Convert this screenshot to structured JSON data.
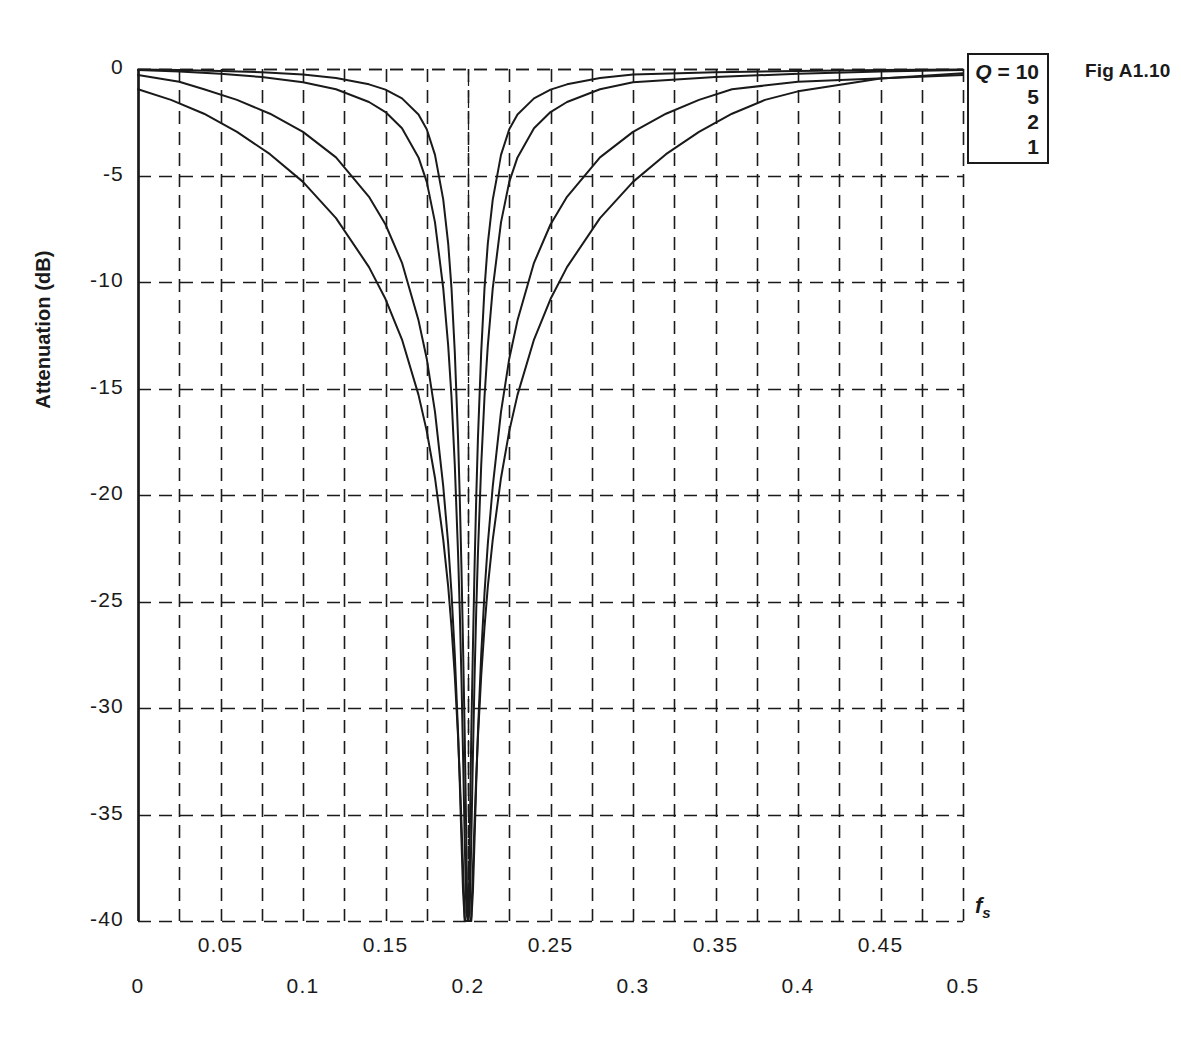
{
  "figure": {
    "fig_label": "Fig A1.10",
    "legend": {
      "q_symbol": "Q",
      "equals": " = ",
      "rows": [
        "10",
        "5",
        "2",
        "1"
      ]
    }
  },
  "chart_data": {
    "type": "line",
    "title": "",
    "xlabel": "f",
    "xlabel_sub": "s",
    "ylabel": "Attenuation (dB)",
    "xlim": [
      0,
      0.5
    ],
    "ylim": [
      -40,
      0
    ],
    "grid": true,
    "grid_x_step": 0.025,
    "grid_y_step": 5,
    "legend_position": "top-right-outside",
    "notch_center": 0.2,
    "x_ticks_upper": [
      "0.05",
      "0.15",
      "0.25",
      "0.35",
      "0.45"
    ],
    "x_ticks_upper_values": [
      0.05,
      0.15,
      0.25,
      0.35,
      0.45
    ],
    "x_ticks_lower": [
      "0",
      "0.1",
      "0.2",
      "0.3",
      "0.4",
      "0.5"
    ],
    "x_ticks_lower_values": [
      0,
      0.1,
      0.2,
      0.3,
      0.4,
      0.5
    ],
    "y_ticks": [
      "0",
      "-5",
      "-10",
      "-15",
      "-20",
      "-25",
      "-30",
      "-35",
      "-40"
    ],
    "y_tick_values": [
      0,
      -5,
      -10,
      -15,
      -20,
      -25,
      -30,
      -35,
      -40
    ],
    "series": [
      {
        "name": "Q = 10",
        "q": 10,
        "color": "#1a1a1a",
        "points": [
          [
            0.0,
            -0.02
          ],
          [
            0.025,
            -0.05
          ],
          [
            0.05,
            -0.09
          ],
          [
            0.075,
            -0.15
          ],
          [
            0.1,
            -0.26
          ],
          [
            0.12,
            -0.42
          ],
          [
            0.14,
            -0.72
          ],
          [
            0.15,
            -0.97
          ],
          [
            0.16,
            -1.38
          ],
          [
            0.17,
            -2.14
          ],
          [
            0.175,
            -2.83
          ],
          [
            0.18,
            -4.03
          ],
          [
            0.185,
            -6.13
          ],
          [
            0.188,
            -8.2
          ],
          [
            0.19,
            -10.3
          ],
          [
            0.192,
            -13.3
          ],
          [
            0.194,
            -17.4
          ],
          [
            0.195,
            -20.1
          ],
          [
            0.196,
            -23.3
          ],
          [
            0.197,
            -27.1
          ],
          [
            0.198,
            -31.2
          ],
          [
            0.199,
            -36.3
          ],
          [
            0.1995,
            -39.2
          ],
          [
            0.2,
            -40.0
          ],
          [
            0.2005,
            -39.2
          ],
          [
            0.201,
            -36.3
          ],
          [
            0.202,
            -31.2
          ],
          [
            0.203,
            -27.1
          ],
          [
            0.204,
            -23.3
          ],
          [
            0.205,
            -20.1
          ],
          [
            0.206,
            -17.4
          ],
          [
            0.208,
            -13.3
          ],
          [
            0.21,
            -10.3
          ],
          [
            0.212,
            -8.2
          ],
          [
            0.215,
            -6.13
          ],
          [
            0.22,
            -4.03
          ],
          [
            0.225,
            -2.83
          ],
          [
            0.23,
            -2.14
          ],
          [
            0.24,
            -1.38
          ],
          [
            0.25,
            -0.97
          ],
          [
            0.26,
            -0.72
          ],
          [
            0.28,
            -0.42
          ],
          [
            0.3,
            -0.26
          ],
          [
            0.35,
            -0.15
          ],
          [
            0.4,
            -0.09
          ],
          [
            0.45,
            -0.05
          ],
          [
            0.5,
            -0.02
          ]
        ]
      },
      {
        "name": "Q = 5",
        "q": 5,
        "color": "#1a1a1a",
        "points": [
          [
            0.0,
            -0.05
          ],
          [
            0.025,
            -0.12
          ],
          [
            0.05,
            -0.22
          ],
          [
            0.075,
            -0.38
          ],
          [
            0.1,
            -0.62
          ],
          [
            0.12,
            -0.95
          ],
          [
            0.14,
            -1.55
          ],
          [
            0.15,
            -2.02
          ],
          [
            0.16,
            -2.78
          ],
          [
            0.17,
            -4.15
          ],
          [
            0.175,
            -5.3
          ],
          [
            0.18,
            -7.2
          ],
          [
            0.185,
            -10.3
          ],
          [
            0.188,
            -13.0
          ],
          [
            0.19,
            -15.4
          ],
          [
            0.192,
            -18.6
          ],
          [
            0.194,
            -22.8
          ],
          [
            0.195,
            -25.4
          ],
          [
            0.196,
            -28.5
          ],
          [
            0.197,
            -32.2
          ],
          [
            0.198,
            -36.2
          ],
          [
            0.199,
            -39.6
          ],
          [
            0.2,
            -40.0
          ],
          [
            0.201,
            -39.6
          ],
          [
            0.202,
            -36.2
          ],
          [
            0.203,
            -32.2
          ],
          [
            0.204,
            -28.5
          ],
          [
            0.205,
            -25.4
          ],
          [
            0.206,
            -22.8
          ],
          [
            0.208,
            -18.6
          ],
          [
            0.21,
            -15.4
          ],
          [
            0.212,
            -13.0
          ],
          [
            0.215,
            -10.3
          ],
          [
            0.22,
            -7.2
          ],
          [
            0.225,
            -5.3
          ],
          [
            0.23,
            -4.15
          ],
          [
            0.24,
            -2.78
          ],
          [
            0.25,
            -2.02
          ],
          [
            0.26,
            -1.55
          ],
          [
            0.28,
            -0.95
          ],
          [
            0.3,
            -0.62
          ],
          [
            0.35,
            -0.38
          ],
          [
            0.4,
            -0.22
          ],
          [
            0.45,
            -0.12
          ],
          [
            0.5,
            -0.05
          ]
        ]
      },
      {
        "name": "Q = 2",
        "q": 2,
        "color": "#1a1a1a",
        "points": [
          [
            0.0,
            -0.28
          ],
          [
            0.025,
            -0.6
          ],
          [
            0.04,
            -0.95
          ],
          [
            0.06,
            -1.45
          ],
          [
            0.08,
            -2.1
          ],
          [
            0.1,
            -2.95
          ],
          [
            0.12,
            -4.15
          ],
          [
            0.14,
            -6.0
          ],
          [
            0.15,
            -7.3
          ],
          [
            0.16,
            -9.1
          ],
          [
            0.17,
            -11.8
          ],
          [
            0.175,
            -13.6
          ],
          [
            0.18,
            -16.1
          ],
          [
            0.185,
            -19.6
          ],
          [
            0.188,
            -22.3
          ],
          [
            0.19,
            -24.6
          ],
          [
            0.192,
            -27.5
          ],
          [
            0.194,
            -31.2
          ],
          [
            0.195,
            -33.5
          ],
          [
            0.196,
            -36.1
          ],
          [
            0.197,
            -38.6
          ],
          [
            0.198,
            -40.0
          ],
          [
            0.202,
            -40.0
          ],
          [
            0.203,
            -38.6
          ],
          [
            0.204,
            -36.1
          ],
          [
            0.205,
            -33.5
          ],
          [
            0.206,
            -31.2
          ],
          [
            0.208,
            -27.5
          ],
          [
            0.21,
            -24.6
          ],
          [
            0.212,
            -22.3
          ],
          [
            0.215,
            -19.6
          ],
          [
            0.22,
            -16.1
          ],
          [
            0.225,
            -13.6
          ],
          [
            0.23,
            -11.8
          ],
          [
            0.24,
            -9.1
          ],
          [
            0.25,
            -7.3
          ],
          [
            0.26,
            -6.0
          ],
          [
            0.28,
            -4.15
          ],
          [
            0.3,
            -2.95
          ],
          [
            0.32,
            -2.1
          ],
          [
            0.34,
            -1.45
          ],
          [
            0.36,
            -0.95
          ],
          [
            0.4,
            -0.6
          ],
          [
            0.5,
            -0.28
          ]
        ]
      },
      {
        "name": "Q = 1",
        "q": 1,
        "color": "#1a1a1a",
        "points": [
          [
            0.0,
            -0.95
          ],
          [
            0.02,
            -1.45
          ],
          [
            0.04,
            -2.1
          ],
          [
            0.06,
            -2.95
          ],
          [
            0.08,
            -4.0
          ],
          [
            0.1,
            -5.3
          ],
          [
            0.12,
            -7.0
          ],
          [
            0.14,
            -9.3
          ],
          [
            0.15,
            -10.8
          ],
          [
            0.16,
            -12.7
          ],
          [
            0.17,
            -15.3
          ],
          [
            0.175,
            -17.0
          ],
          [
            0.18,
            -19.2
          ],
          [
            0.185,
            -22.1
          ],
          [
            0.188,
            -24.3
          ],
          [
            0.19,
            -26.2
          ],
          [
            0.192,
            -28.5
          ],
          [
            0.194,
            -31.4
          ],
          [
            0.195,
            -33.2
          ],
          [
            0.196,
            -35.3
          ],
          [
            0.197,
            -37.5
          ],
          [
            0.198,
            -39.8
          ],
          [
            0.1985,
            -40.0
          ],
          [
            0.2015,
            -40.0
          ],
          [
            0.202,
            -39.8
          ],
          [
            0.203,
            -37.5
          ],
          [
            0.204,
            -35.3
          ],
          [
            0.205,
            -33.2
          ],
          [
            0.206,
            -31.4
          ],
          [
            0.208,
            -28.5
          ],
          [
            0.21,
            -26.2
          ],
          [
            0.212,
            -24.3
          ],
          [
            0.215,
            -22.1
          ],
          [
            0.22,
            -19.2
          ],
          [
            0.225,
            -17.0
          ],
          [
            0.23,
            -15.3
          ],
          [
            0.24,
            -12.7
          ],
          [
            0.25,
            -10.8
          ],
          [
            0.26,
            -9.3
          ],
          [
            0.28,
            -7.0
          ],
          [
            0.3,
            -5.3
          ],
          [
            0.32,
            -4.0
          ],
          [
            0.34,
            -2.95
          ],
          [
            0.36,
            -2.1
          ],
          [
            0.38,
            -1.45
          ],
          [
            0.4,
            -1.05
          ],
          [
            0.45,
            -0.45
          ],
          [
            0.5,
            -0.2
          ]
        ]
      }
    ]
  }
}
